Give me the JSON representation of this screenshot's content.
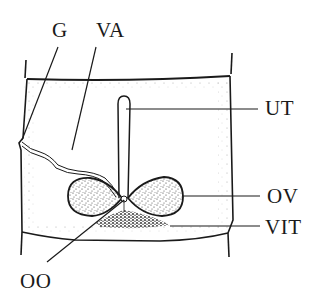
{
  "diagram": {
    "labels": [
      {
        "id": "G",
        "text": "G",
        "x": 52,
        "y": 22
      },
      {
        "id": "VA",
        "text": "VA",
        "x": 96,
        "y": 22
      },
      {
        "id": "UT",
        "text": "UT",
        "x": 265,
        "y": 98
      },
      {
        "id": "OV",
        "text": "OV",
        "x": 267,
        "y": 174
      },
      {
        "id": "VIT",
        "text": "VIT",
        "x": 265,
        "y": 206
      },
      {
        "id": "OO",
        "text": "OO",
        "x": 20,
        "y": 271
      }
    ],
    "colors": {
      "ink": "#1a1a1a",
      "stipple": "#555555",
      "background": "#ffffff"
    }
  }
}
